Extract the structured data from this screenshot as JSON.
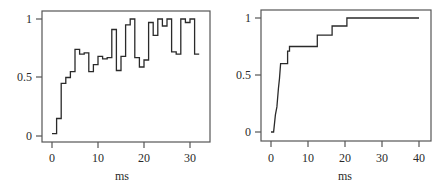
{
  "chart_data": [
    {
      "type": "line",
      "style": "step",
      "title": "",
      "xlabel": "ms",
      "ylabel": "",
      "xlim": [
        -2,
        35
      ],
      "ylim": [
        -0.02,
        1.05
      ],
      "xticks": [
        0,
        10,
        20,
        30
      ],
      "xtick_labels": [
        "0",
        "10",
        "20",
        "30"
      ],
      "yticks": [
        0,
        0.5,
        1
      ],
      "ytick_labels": [
        "0",
        "0.5",
        "1"
      ],
      "grid": false,
      "legend": null,
      "x": [
        0,
        1,
        2,
        3,
        4,
        5,
        6,
        7,
        8,
        9,
        10,
        11,
        12,
        13,
        14,
        15,
        16,
        17,
        18,
        19,
        20,
        21,
        22,
        23,
        24,
        25,
        26,
        27,
        28,
        29,
        30,
        31,
        32
      ],
      "values": [
        0.02,
        0.15,
        0.45,
        0.5,
        0.55,
        0.74,
        0.7,
        0.71,
        0.55,
        0.61,
        0.68,
        0.66,
        0.67,
        0.91,
        0.56,
        0.68,
        0.95,
        1.0,
        0.67,
        0.59,
        0.65,
        0.97,
        0.86,
        1.0,
        0.94,
        1.0,
        0.72,
        0.7,
        1.0,
        0.97,
        1.0,
        0.7,
        0.7
      ]
    },
    {
      "type": "line",
      "style": "step",
      "title": "",
      "xlabel": "ms",
      "ylabel": "",
      "xlim": [
        -2,
        43
      ],
      "ylim": [
        -0.05,
        1.05
      ],
      "xticks": [
        0,
        10,
        20,
        30,
        40
      ],
      "xtick_labels": [
        "0",
        "10",
        "20",
        "30",
        "40"
      ],
      "yticks": [
        0,
        0.5,
        1
      ],
      "ytick_labels": [
        "0",
        "0.5",
        "1"
      ],
      "grid": false,
      "legend": null,
      "x": [
        0,
        0.7,
        1.2,
        1.6,
        2.0,
        2.3,
        2.6,
        3.0,
        4.5,
        5.0,
        12.5,
        16.5,
        20.5,
        40
      ],
      "values": [
        0,
        0,
        0.15,
        0.22,
        0.38,
        0.47,
        0.6,
        0.6,
        0.71,
        0.75,
        0.85,
        0.93,
        1.0,
        1.0
      ]
    }
  ],
  "charts": [
    {
      "xlabel": "ms",
      "xtick_labels": [
        "0",
        "10",
        "20",
        "30"
      ],
      "ytick_labels": [
        "0",
        "0.5",
        "1"
      ]
    },
    {
      "xlabel": "ms",
      "xtick_labels": [
        "0",
        "10",
        "20",
        "30",
        "40"
      ],
      "ytick_labels": [
        "0",
        "0.5",
        "1"
      ]
    }
  ]
}
